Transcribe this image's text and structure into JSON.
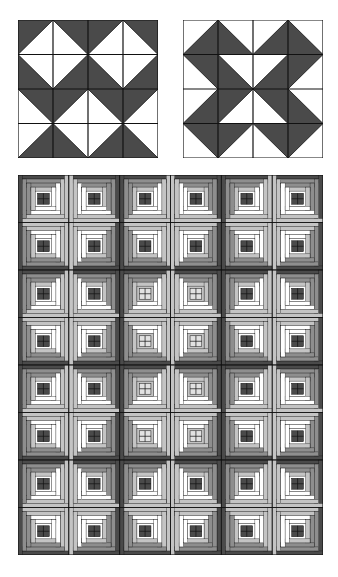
{
  "colors": {
    "dark": "#4a4a4a",
    "mid": "#8e8e8e",
    "light": "#c4c4c4",
    "white": "#ffffff",
    "line": "#111111"
  },
  "block_a": {
    "label": "Half-square triangle block A",
    "grid": 4,
    "cells": [
      [
        "TL",
        "TR",
        "TL",
        "TR"
      ],
      [
        "BL",
        "BR",
        "BL",
        "BR"
      ],
      [
        "TR",
        "TL",
        "TR",
        "TL"
      ],
      [
        "BR",
        "BL",
        "BR",
        "BL"
      ]
    ]
  },
  "block_b": {
    "label": "Half-square triangle block B",
    "grid": 4,
    "cells": [
      [
        "BR",
        "BL",
        "BR",
        "BL"
      ],
      [
        "TR",
        "A",
        "B",
        "TL"
      ],
      [
        "BR",
        "C",
        "D",
        "BL"
      ],
      [
        "TR",
        "TL",
        "TR",
        "TL"
      ]
    ]
  },
  "quilt": {
    "label": "Log cabin quilt",
    "cols": 6,
    "rows": 8,
    "centers": [
      [
        "dark",
        "dark",
        "dark",
        "dark",
        "dark",
        "dark"
      ],
      [
        "dark",
        "dark",
        "dark",
        "dark",
        "dark",
        "dark"
      ],
      [
        "dark",
        "dark",
        "light",
        "light",
        "dark",
        "dark"
      ],
      [
        "dark",
        "dark",
        "light",
        "light",
        "dark",
        "dark"
      ],
      [
        "dark",
        "dark",
        "light",
        "light",
        "dark",
        "dark"
      ],
      [
        "dark",
        "dark",
        "light",
        "light",
        "dark",
        "dark"
      ],
      [
        "dark",
        "dark",
        "dark",
        "dark",
        "dark",
        "dark"
      ],
      [
        "dark",
        "dark",
        "dark",
        "dark",
        "dark",
        "dark"
      ]
    ],
    "rotations": [
      [
        0,
        1,
        0,
        1,
        0,
        1
      ],
      [
        3,
        2,
        3,
        2,
        3,
        2
      ],
      [
        0,
        1,
        0,
        1,
        0,
        1
      ],
      [
        3,
        2,
        3,
        2,
        3,
        2
      ],
      [
        0,
        1,
        0,
        1,
        0,
        1
      ],
      [
        3,
        2,
        3,
        2,
        3,
        2
      ],
      [
        0,
        1,
        0,
        1,
        0,
        1
      ],
      [
        3,
        2,
        3,
        2,
        3,
        2
      ]
    ]
  }
}
